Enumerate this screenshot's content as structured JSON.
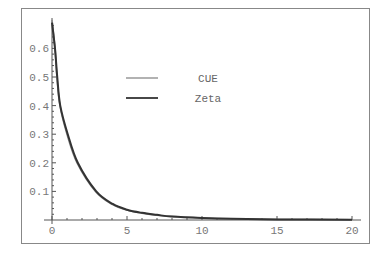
{
  "chart_data": {
    "type": "line",
    "title": "",
    "xlabel": "",
    "ylabel": "",
    "xlim": [
      0,
      20
    ],
    "ylim": [
      0,
      0.7
    ],
    "grid": false,
    "frame": true,
    "legend_position": "inside-upper-center",
    "x_ticks": [
      0,
      5,
      10,
      15,
      20
    ],
    "x_tick_labels": [
      "0",
      "5",
      "10",
      "15",
      "20"
    ],
    "y_ticks": [
      0.1,
      0.2,
      0.3,
      0.4,
      0.5,
      0.6
    ],
    "y_tick_labels": [
      "0.1",
      "0.2",
      "0.3",
      "0.4",
      "0.5",
      "0.6"
    ],
    "series": [
      {
        "name": "CUE",
        "color": "#888888",
        "x": [
          0,
          0.2,
          0.33,
          0.53,
          1.0,
          1.67,
          2.9,
          4,
          5,
          6,
          7,
          8,
          10,
          12,
          15,
          20
        ],
        "y": [
          0.7,
          0.6,
          0.5,
          0.4,
          0.3,
          0.2,
          0.1,
          0.055,
          0.035,
          0.024,
          0.017,
          0.012,
          0.007,
          0.004,
          0.002,
          0.001
        ]
      },
      {
        "name": "Zeta",
        "color": "#333333",
        "x": [
          0,
          0.2,
          0.35,
          0.55,
          1.05,
          1.72,
          2.95,
          4.05,
          5,
          6,
          7,
          8,
          10,
          12,
          15,
          20
        ],
        "y": [
          0.69,
          0.6,
          0.5,
          0.4,
          0.3,
          0.2,
          0.1,
          0.056,
          0.036,
          0.025,
          0.018,
          0.012,
          0.007,
          0.004,
          0.002,
          0.001
        ]
      }
    ]
  },
  "legend": {
    "items": [
      {
        "label": "CUE",
        "color": "#888888"
      },
      {
        "label": "Zeta",
        "color": "#333333"
      }
    ]
  }
}
